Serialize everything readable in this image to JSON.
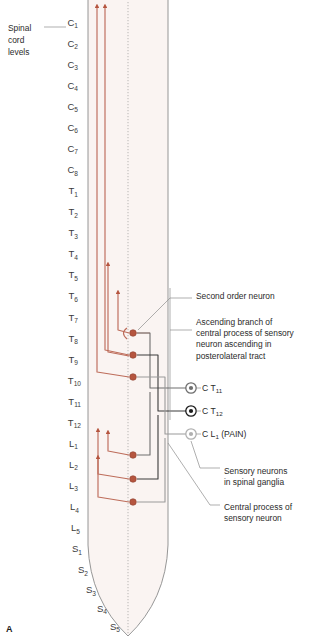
{
  "figure": {
    "panel_letter": "A",
    "title_note": "Spinal cord levels with sensory neuron pathways"
  },
  "colors": {
    "cord_fill": "#faf4f2",
    "cord_outline": "#8a8a8a",
    "midline": "#9b9b9b",
    "red_pathway": "#bd6c5a",
    "red_pathway_pale": "#d09d90",
    "synapse_dot": "#b5553f",
    "dark_pathway": "#3b3b3b",
    "mid_pathway": "#6e6e6e",
    "light_pathway": "#9a9a9a",
    "leader_line": "#8d8d8d",
    "text": "#2b2b2b"
  },
  "left_caption": {
    "lines": [
      "Spinal",
      "cord",
      "levels"
    ],
    "has_leader_to": "C1"
  },
  "levels": [
    {
      "main": "C",
      "sub": "1",
      "x": 78,
      "y": 28
    },
    {
      "main": "C",
      "sub": "2",
      "x": 78,
      "y": 51
    },
    {
      "main": "C",
      "sub": "3",
      "x": 78,
      "y": 74
    },
    {
      "main": "C",
      "sub": "4",
      "x": 78,
      "y": 97
    },
    {
      "main": "C",
      "sub": "5",
      "x": 78,
      "y": 120
    },
    {
      "main": "C",
      "sub": "6",
      "x": 78,
      "y": 143
    },
    {
      "main": "C",
      "sub": "7",
      "x": 78,
      "y": 166
    },
    {
      "main": "C",
      "sub": "8",
      "x": 78,
      "y": 189
    },
    {
      "main": "T",
      "sub": "1",
      "x": 78,
      "y": 212
    },
    {
      "main": "T",
      "sub": "2",
      "x": 78,
      "y": 235
    },
    {
      "main": "T",
      "sub": "3",
      "x": 78,
      "y": 258
    },
    {
      "main": "T",
      "sub": "4",
      "x": 78,
      "y": 281
    },
    {
      "main": "T",
      "sub": "5",
      "x": 78,
      "y": 304
    },
    {
      "main": "T",
      "sub": "6",
      "x": 78,
      "y": 327
    },
    {
      "main": "T",
      "sub": "7",
      "x": 78,
      "y": 350
    },
    {
      "main": "T",
      "sub": "8",
      "x": 78,
      "y": 373
    },
    {
      "main": "T",
      "sub": "9",
      "x": 78,
      "y": 396
    },
    {
      "main": "T",
      "sub": "10",
      "x": 81,
      "y": 419
    },
    {
      "main": "T",
      "sub": "11",
      "x": 81,
      "y": 442
    },
    {
      "main": "T",
      "sub": "12",
      "x": 81,
      "y": 465
    },
    {
      "main": "L",
      "sub": "1",
      "x": 78,
      "y": 488
    },
    {
      "main": "L",
      "sub": "2",
      "x": 78,
      "y": 511
    },
    {
      "main": "L",
      "sub": "3",
      "x": 78,
      "y": 534
    },
    {
      "main": "L",
      "sub": "4",
      "x": 79,
      "y": 557
    },
    {
      "main": "L",
      "sub": "5",
      "x": 80,
      "y": 580
    },
    {
      "main": "S",
      "sub": "1",
      "x": 82,
      "y": 603
    },
    {
      "main": "S",
      "sub": "2",
      "x": 88,
      "y": 626
    },
    {
      "main": "S",
      "sub": "3",
      "x": 96,
      "y": 648
    },
    {
      "main": "S",
      "sub": "4",
      "x": 107,
      "y": 668
    },
    {
      "main": "S",
      "sub": "5",
      "x": 120,
      "y": 688
    }
  ],
  "annotations": [
    {
      "id": "second-order-neuron",
      "lines": [
        "Second order neuron"
      ],
      "x": 196,
      "y": 299
    },
    {
      "id": "ascending-branch",
      "lines": [
        "Ascending branch of",
        "central process of sensory",
        "neuron ascending in",
        "posterolateral tract"
      ],
      "x": 196,
      "y": 325
    },
    {
      "id": "sensory-neurons-ganglia",
      "lines": [
        "Sensory neurons",
        "in spinal ganglia"
      ],
      "x": 224,
      "y": 474
    },
    {
      "id": "central-process",
      "lines": [
        "Central process of",
        "sensory neuron"
      ],
      "x": 224,
      "y": 510
    }
  ],
  "ganglia": [
    {
      "id": "ganglion-t11",
      "main": "C ",
      "label_main": "T",
      "label_sub": "11",
      "cx": 191,
      "cy": 388,
      "shade": "#6e6e6e"
    },
    {
      "id": "ganglion-t12",
      "main": "C ",
      "label_main": "T",
      "label_sub": "12",
      "cx": 191,
      "cy": 411,
      "shade": "#1a1a1a"
    },
    {
      "id": "ganglion-l1",
      "main": "C ",
      "label_main": "L",
      "label_sub": "1",
      "suffix": " (PAIN)",
      "cx": 191,
      "cy": 434,
      "shade": "#b0b0b0"
    }
  ],
  "synapses_upper": [
    {
      "id": "synapse-t8",
      "cx": 133,
      "cy": 333
    },
    {
      "id": "synapse-t9",
      "cx": 133,
      "cy": 355
    },
    {
      "id": "synapse-t10",
      "cx": 133,
      "cy": 377
    }
  ],
  "synapses_lower": [
    {
      "id": "synapse-l2",
      "cx": 133,
      "cy": 455
    },
    {
      "id": "synapse-l3",
      "cx": 133,
      "cy": 479
    },
    {
      "id": "synapse-l4",
      "cx": 133,
      "cy": 502
    }
  ],
  "arrows": [
    {
      "id": "ascending-arrow-long-1",
      "x": 97,
      "top": 4,
      "label": "long ascending tract left"
    },
    {
      "id": "ascending-arrow-long-2",
      "x": 105,
      "top": 4,
      "label": "long ascending tract right"
    },
    {
      "id": "ascending-arrow-mid-1",
      "x": 108,
      "top": 262,
      "label": "mid ascending branch left"
    },
    {
      "id": "ascending-arrow-mid-2",
      "x": 118,
      "top": 290,
      "label": "mid ascending branch right"
    },
    {
      "id": "ascending-arrow-low-1",
      "x": 98,
      "top": 428,
      "label": "low ascending branch left"
    },
    {
      "id": "ascending-arrow-low-2",
      "x": 98,
      "top": 455,
      "label": "low ascending branch right"
    }
  ]
}
